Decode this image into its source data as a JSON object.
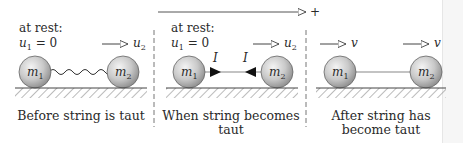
{
  "direction_axis": {
    "label": "+"
  },
  "panels": [
    {
      "id": "before",
      "top_text_line1": "at rest:",
      "top_text_line2_var": "u",
      "top_text_line2_sub": "1",
      "top_text_line2_rest": " = 0",
      "right_velocity_var": "u",
      "right_velocity_sub": "2",
      "mass1_var": "m",
      "mass1_sub": "1",
      "mass2_var": "m",
      "mass2_sub": "2",
      "connector": "slack-string",
      "caption_line1": "Before string is taut",
      "caption_line2": ""
    },
    {
      "id": "during",
      "top_text_line1": "at rest:",
      "top_text_line2_var": "u",
      "top_text_line2_sub": "1",
      "top_text_line2_rest": " = 0",
      "right_velocity_var": "u",
      "right_velocity_sub": "2",
      "mass1_var": "m",
      "mass1_sub": "1",
      "mass2_var": "m",
      "mass2_sub": "2",
      "connector": "taut-string-with-impulses",
      "impulse_label_left": "I",
      "impulse_label_right": "I",
      "caption_line1": "When string becomes",
      "caption_line2": "taut"
    },
    {
      "id": "after",
      "left_velocity_var": "v",
      "right_velocity_var": "v",
      "mass1_var": "m",
      "mass1_sub": "1",
      "mass2_var": "m",
      "mass2_sub": "2",
      "connector": "taut-string",
      "caption_line1": "After string has",
      "caption_line2": "become taut"
    }
  ]
}
